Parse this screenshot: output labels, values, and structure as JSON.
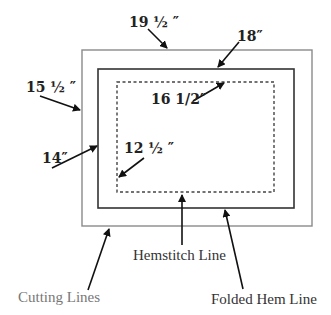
{
  "diagram": {
    "rectangles": {
      "cutting": {
        "label": "19 ½ ″",
        "height_label": "15 ½ ″",
        "color": "#888888"
      },
      "folded_hem": {
        "label": "18″",
        "height_label": "14″",
        "color": "#333333"
      },
      "hemstitch": {
        "label": "16 1/2″",
        "height_label": "12 ½ ″",
        "color": "#444444",
        "style": "dotted"
      }
    },
    "callouts": {
      "cutting_lines": "Cutting Lines",
      "hemstitch_line": "Hemstitch Line",
      "folded_hem_line": "Folded Hem Line"
    }
  }
}
